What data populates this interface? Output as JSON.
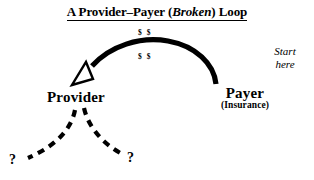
{
  "diagram": {
    "title": {
      "prefix": "A Provider–Payer (",
      "emphasis": "Broken",
      "suffix": ") Loop",
      "full": "A Provider–Payer (Broken) Loop"
    },
    "nodes": {
      "provider": {
        "label": "Provider"
      },
      "payer": {
        "label": "Payer",
        "sublabel": "(Insurance)"
      }
    },
    "annotations": {
      "money_top": "$ $",
      "money_bottom": "$ $",
      "start_here_line1": "Start",
      "start_here_line2": "here",
      "question_left": "?",
      "question_right": "?"
    },
    "edges": {
      "payment_arc": {
        "from": "Payer",
        "to": "Provider",
        "style": "solid-curved-arrow",
        "label": "$ $"
      },
      "broken_branch_left": {
        "from": "Provider",
        "to": "?",
        "style": "dashed-curve"
      },
      "broken_branch_right": {
        "from": "Provider",
        "to": "?",
        "style": "dashed-curve"
      }
    },
    "colors": {
      "ink": "#000000",
      "background": "#ffffff"
    }
  }
}
